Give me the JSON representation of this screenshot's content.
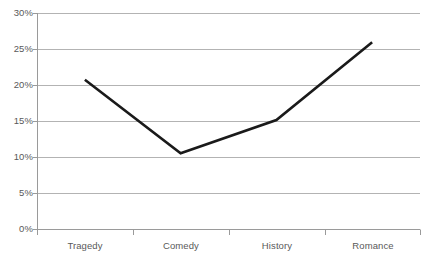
{
  "chart_data": {
    "type": "line",
    "title": "",
    "xlabel": "",
    "ylabel": "",
    "categories": [
      "Tragedy",
      "Comedy",
      "History",
      "Romance"
    ],
    "values": [
      20.8,
      10.6,
      15.2,
      26.0
    ],
    "series": [
      {
        "name": "",
        "values": [
          20.8,
          10.6,
          15.2,
          26.0
        ]
      }
    ],
    "ylim": [
      0,
      30
    ],
    "ytick_values": [
      0,
      5,
      10,
      15,
      20,
      25,
      30
    ],
    "ytick_labels": [
      "0%",
      "5%",
      "10%",
      "15%",
      "20%",
      "25%",
      "30%"
    ],
    "xtick_labels": [
      "Tragedy",
      "Comedy",
      "History",
      "Romance"
    ],
    "grid": "horizontal",
    "legend": "none",
    "line_color": "#1a1a1a",
    "grid_color": "#b3b3b3",
    "axis_color": "#9a9a9a",
    "text_color": "#595959",
    "background_color": "#ffffff"
  }
}
